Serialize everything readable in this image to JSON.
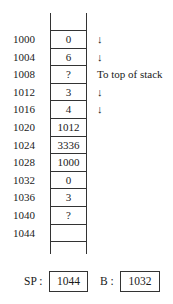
{
  "stack": {
    "rows": [
      {
        "address": "1000",
        "value": "0",
        "note": "↓"
      },
      {
        "address": "1004",
        "value": "6",
        "note": "↓"
      },
      {
        "address": "1008",
        "value": "?",
        "note": "To top of stack"
      },
      {
        "address": "1012",
        "value": "3",
        "note": "↓"
      },
      {
        "address": "1016",
        "value": "4",
        "note": "↓"
      },
      {
        "address": "1020",
        "value": "1012",
        "note": ""
      },
      {
        "address": "1024",
        "value": "3336",
        "note": ""
      },
      {
        "address": "1028",
        "value": "1000",
        "note": ""
      },
      {
        "address": "1032",
        "value": "0",
        "note": ""
      },
      {
        "address": "1036",
        "value": "3",
        "note": ""
      },
      {
        "address": "1040",
        "value": "?",
        "note": ""
      },
      {
        "address": "1044",
        "value": "",
        "note": ""
      },
      {
        "address": "",
        "value": "",
        "note": ""
      }
    ]
  },
  "registers": {
    "sp": {
      "label": "SP :",
      "value": "1044"
    },
    "b": {
      "label": "B :",
      "value": "1032"
    }
  }
}
